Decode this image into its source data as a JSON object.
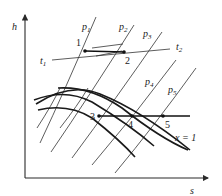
{
  "diagram": {
    "type": "h-s diagram",
    "axes": {
      "y_label": "h",
      "x_label": "s"
    },
    "isobars": [
      {
        "label": "p",
        "sub": "1"
      },
      {
        "label": "p",
        "sub": "2"
      },
      {
        "label": "p",
        "sub": "3"
      },
      {
        "label": "p",
        "sub": "4"
      },
      {
        "label": "p",
        "sub": "5"
      }
    ],
    "isotherms": [
      {
        "label": "t",
        "sub": "1"
      },
      {
        "label": "t",
        "sub": "2"
      }
    ],
    "quality_line": {
      "label": "x = 1"
    },
    "points": [
      "1",
      "2",
      "3",
      "4",
      "5"
    ]
  }
}
